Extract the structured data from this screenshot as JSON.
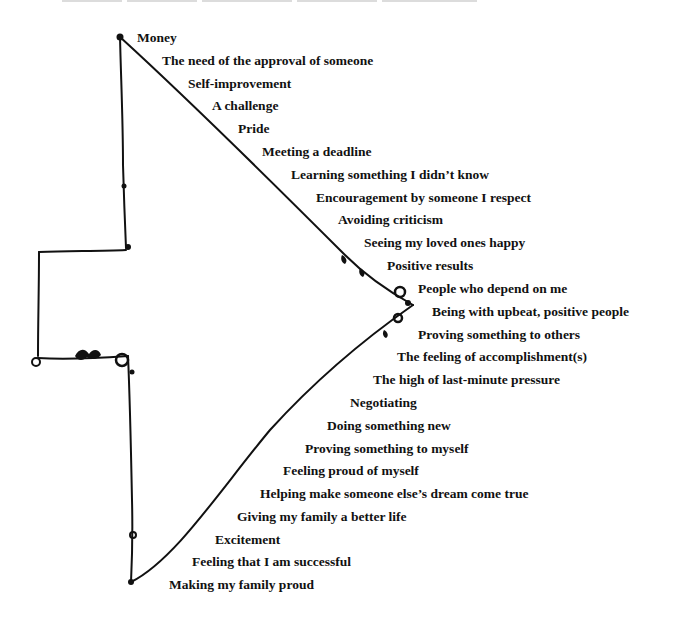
{
  "diagram": {
    "type": "arrow-list",
    "direction": "right",
    "ink_color": "#111111",
    "background": "#ffffff",
    "header_cropped": true
  },
  "labels": [
    {
      "text": "Money",
      "x": 137,
      "y": 30
    },
    {
      "text": "The need of the approval of someone",
      "x": 162,
      "y": 53
    },
    {
      "text": "Self-improvement",
      "x": 188,
      "y": 76
    },
    {
      "text": "A challenge",
      "x": 212,
      "y": 98
    },
    {
      "text": "Pride",
      "x": 238,
      "y": 121
    },
    {
      "text": "Meeting a deadline",
      "x": 262,
      "y": 144
    },
    {
      "text": "Learning something I didn’t know",
      "x": 291,
      "y": 167
    },
    {
      "text": "Encouragement by someone I respect",
      "x": 316,
      "y": 190
    },
    {
      "text": "Avoiding criticism",
      "x": 338,
      "y": 212
    },
    {
      "text": "Seeing my loved ones happy",
      "x": 364,
      "y": 235
    },
    {
      "text": "Positive results",
      "x": 387,
      "y": 258
    },
    {
      "text": "People who depend on me",
      "x": 418,
      "y": 281
    },
    {
      "text": "Being with upbeat, positive people",
      "x": 432,
      "y": 304
    },
    {
      "text": "Proving something to others",
      "x": 418,
      "y": 327
    },
    {
      "text": "The feeling of accomplishment(s)",
      "x": 397,
      "y": 349
    },
    {
      "text": "The high of last-minute pressure",
      "x": 373,
      "y": 372
    },
    {
      "text": "Negotiating",
      "x": 350,
      "y": 395
    },
    {
      "text": "Doing something new",
      "x": 327,
      "y": 418
    },
    {
      "text": "Proving something to myself",
      "x": 305,
      "y": 441
    },
    {
      "text": "Feeling proud of myself",
      "x": 283,
      "y": 463
    },
    {
      "text": "Helping make someone else’s dream come true",
      "x": 260,
      "y": 486
    },
    {
      "text": "Giving my family a better life",
      "x": 237,
      "y": 509
    },
    {
      "text": "Excitement",
      "x": 215,
      "y": 532
    },
    {
      "text": "Feeling that I am successful",
      "x": 192,
      "y": 554
    },
    {
      "text": "Making my family proud",
      "x": 169,
      "y": 577
    }
  ]
}
